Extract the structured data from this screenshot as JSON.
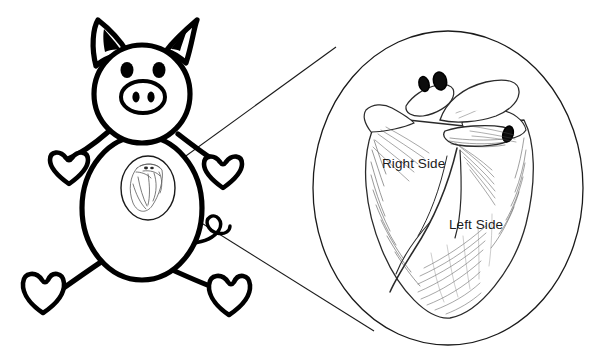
{
  "figure": {
    "background_color": "#ffffff",
    "ink_color": "#000000",
    "sketch_color": "#3a3a3a",
    "label_color": "#1b1b1b"
  },
  "subject": {
    "name": "cartoon-pig",
    "parts": [
      "ears",
      "head",
      "eyes",
      "snout",
      "nostrils",
      "body",
      "arms",
      "hoof-hands",
      "legs",
      "hoof-feet",
      "curly-tail",
      "heart-inset-oval"
    ]
  },
  "callout": {
    "shape": "circle",
    "center_x": 448,
    "center_y": 188,
    "radius_x": 135,
    "radius_y": 157,
    "source_x": 148,
    "source_y": 185,
    "leader_lines": 2
  },
  "magnified_view": {
    "subject": "pig-heart",
    "labels": [
      {
        "id": "right-side",
        "text": "Right Side",
        "x": 382,
        "y": 168
      },
      {
        "id": "left-side",
        "text": "Left Side",
        "x": 449,
        "y": 229
      }
    ],
    "vessel_openings": 3
  }
}
